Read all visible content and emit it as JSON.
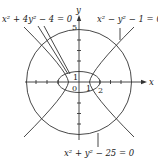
{
  "figure": {
    "axes": {
      "x_label": "x",
      "y_label": "y",
      "origin_label": "0",
      "tick_labels": {
        "y_top": "5",
        "y_one": "1",
        "x_one": "1",
        "x_two": "2"
      }
    },
    "curves": [
      {
        "name": "ellipse",
        "equation": "x² + 4y² − 4 = 0"
      },
      {
        "name": "hyperbola",
        "equation": "x² − y² − 1 = 0"
      },
      {
        "name": "circle",
        "equation": "x² + y² − 25 = 0"
      }
    ],
    "colors": {
      "stroke": "#333333",
      "text": "#222222",
      "background": "#ffffff"
    }
  }
}
